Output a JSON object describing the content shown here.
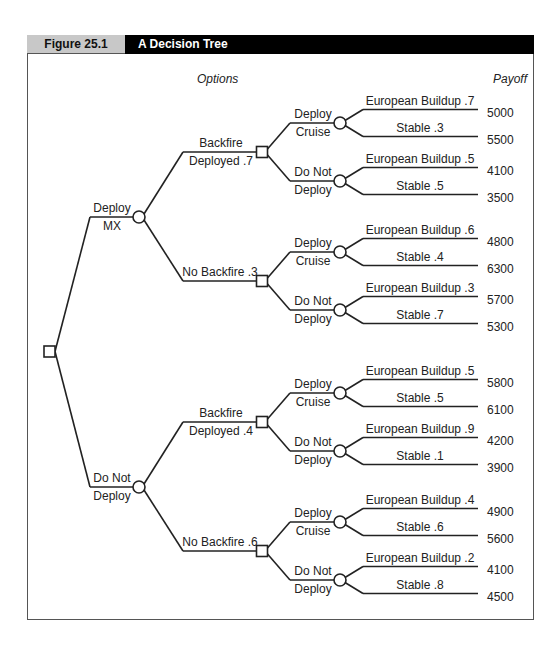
{
  "header": {
    "figure_number": "Figure 25.1",
    "title": "A Decision Tree"
  },
  "columns": {
    "options": "Options",
    "payoff": "Payoff"
  },
  "colors": {
    "line": "#222222",
    "header_gray": "#c8c8c8",
    "header_black": "#000000"
  },
  "tree": {
    "root_node": "decision-square",
    "branches": [
      {
        "label_top": "Deploy",
        "label_bottom": "MX",
        "children": [
          {
            "label_top": "Backfire",
            "label_bottom": "Deployed .7",
            "children": [
              {
                "label_top": "Deploy",
                "label_bottom": "Cruise",
                "outcomes": [
                  {
                    "label": "European Buildup .7",
                    "payoff": "5000"
                  },
                  {
                    "label": "Stable .3",
                    "payoff": "5500"
                  }
                ]
              },
              {
                "label_top": "Do Not",
                "label_bottom": "Deploy",
                "outcomes": [
                  {
                    "label": "European Buildup .5",
                    "payoff": "4100"
                  },
                  {
                    "label": "Stable .5",
                    "payoff": "3500"
                  }
                ]
              }
            ]
          },
          {
            "label_top": "No Backfire .3",
            "label_bottom": "",
            "children": [
              {
                "label_top": "Deploy",
                "label_bottom": "Cruise",
                "outcomes": [
                  {
                    "label": "European Buildup .6",
                    "payoff": "4800"
                  },
                  {
                    "label": "Stable .4",
                    "payoff": "6300"
                  }
                ]
              },
              {
                "label_top": "Do Not",
                "label_bottom": "Deploy",
                "outcomes": [
                  {
                    "label": "European Buildup .3",
                    "payoff": "5700"
                  },
                  {
                    "label": "Stable .7",
                    "payoff": "5300"
                  }
                ]
              }
            ]
          }
        ]
      },
      {
        "label_top": "Do Not",
        "label_bottom": "Deploy",
        "children": [
          {
            "label_top": "Backfire",
            "label_bottom": "Deployed .4",
            "children": [
              {
                "label_top": "Deploy",
                "label_bottom": "Cruise",
                "outcomes": [
                  {
                    "label": "European Buildup .5",
                    "payoff": "5800"
                  },
                  {
                    "label": "Stable .5",
                    "payoff": "6100"
                  }
                ]
              },
              {
                "label_top": "Do Not",
                "label_bottom": "Deploy",
                "outcomes": [
                  {
                    "label": "European Buildup .9",
                    "payoff": "4200"
                  },
                  {
                    "label": "Stable .1",
                    "payoff": "3900"
                  }
                ]
              }
            ]
          },
          {
            "label_top": "No Backfire .6",
            "label_bottom": "",
            "children": [
              {
                "label_top": "Deploy",
                "label_bottom": "Cruise",
                "outcomes": [
                  {
                    "label": "European Buildup .4",
                    "payoff": "4900"
                  },
                  {
                    "label": "Stable .6",
                    "payoff": "5600"
                  }
                ]
              },
              {
                "label_top": "Do Not",
                "label_bottom": "Deploy",
                "outcomes": [
                  {
                    "label": "European Buildup .2",
                    "payoff": "4100"
                  },
                  {
                    "label": "Stable .8",
                    "payoff": "4500"
                  }
                ]
              }
            ]
          }
        ]
      }
    ]
  }
}
